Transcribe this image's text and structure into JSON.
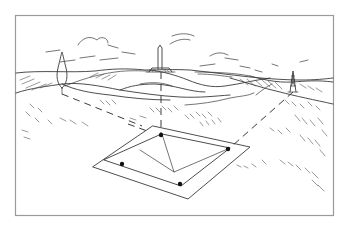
{
  "illustration": {
    "description": "Line-art landscape with a perspective sighting frame on the ground, dashed sight lines to distant landmarks",
    "colors": {
      "background": "#ffffff",
      "line": "#3a3a3a",
      "border": "#9a9a9a",
      "dot": "#111111"
    },
    "landmarks": [
      {
        "name": "cypress-tree",
        "x": 62,
        "y": 70
      },
      {
        "name": "obelisk-monument",
        "x": 161,
        "y": 58
      },
      {
        "name": "power-pylon",
        "x": 293,
        "y": 80
      }
    ],
    "frame": {
      "outer": [
        [
          138,
          125
        ],
        [
          250,
          145
        ],
        [
          184,
          200
        ],
        [
          60,
          167
        ]
      ],
      "inner": [
        [
          160,
          133
        ],
        [
          234,
          142
        ],
        [
          187,
          189
        ],
        [
          72,
          159
        ]
      ],
      "apex": [
        174,
        172
      ],
      "pins": [
        [
          161,
          135
        ],
        [
          230,
          147
        ],
        [
          179,
          185
        ],
        [
          122,
          157
        ]
      ]
    },
    "border": {
      "x": 15,
      "y": 15,
      "width": 318,
      "height": 200
    }
  }
}
